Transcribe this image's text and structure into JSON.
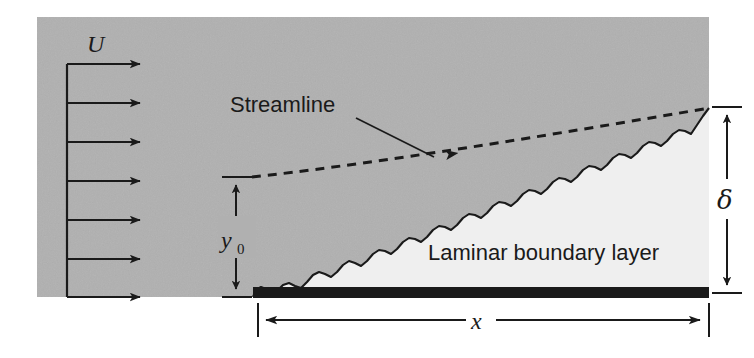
{
  "figure": {
    "type": "technical-diagram"
  },
  "labels": {
    "freestream_velocity": "U",
    "streamline": "Streamline",
    "boundary_layer": "Laminar boundary layer",
    "y_zero_symbol": "y",
    "y_zero_subscript": "0",
    "delta": "δ",
    "plate_length": "x"
  },
  "colors": {
    "freestream_fill": "#b0b0b0",
    "boundary_layer_fill": "#eeeeee",
    "plate_fill": "#1a1a1a",
    "line": "#1a1a1a",
    "page_background": "#ffffff",
    "text": "#1a1a1a"
  },
  "geometry": {
    "freestream_region": {
      "x": 37,
      "y": 17,
      "width": 672,
      "height": 280
    },
    "plate": {
      "x": 253,
      "y": 287,
      "width": 456,
      "height": 11
    },
    "velocity_profile": {
      "axis_x": 67,
      "tip_x": 147,
      "arrow_count": 7,
      "arrow_y": [
        64,
        103,
        142,
        181,
        220,
        259,
        297
      ]
    },
    "streamline": {
      "start_x": 252,
      "start_y": 177,
      "end_x": 709,
      "end_y": 108,
      "arrow_x": 450,
      "arrow_y": 153
    },
    "dimension_y0": {
      "x": 236,
      "top_y": 177,
      "bottom_y": 297
    },
    "dimension_delta": {
      "x": 727,
      "top_y": 107,
      "bottom_y": 293
    },
    "dimension_x": {
      "y": 320,
      "left_x": 258,
      "right_x": 709
    }
  },
  "annotations": {
    "streamline_leader": {
      "from_x": 356,
      "from_y": 118,
      "to_x": 432,
      "to_y": 156
    }
  }
}
